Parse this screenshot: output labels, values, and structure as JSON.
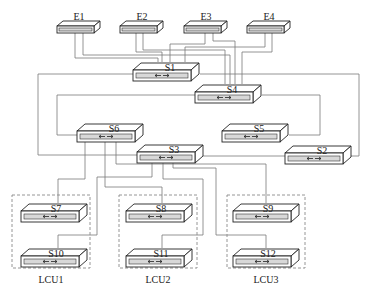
{
  "diagram": {
    "type": "network-topology",
    "nodes": {
      "E1": {
        "label": "E1",
        "kind": "endpoint-switch"
      },
      "E2": {
        "label": "E2",
        "kind": "endpoint-switch"
      },
      "E3": {
        "label": "E3",
        "kind": "endpoint-switch"
      },
      "E4": {
        "label": "E4",
        "kind": "endpoint-switch"
      },
      "S1": {
        "label": "S1",
        "kind": "switch"
      },
      "S2": {
        "label": "S2",
        "kind": "switch"
      },
      "S3": {
        "label": "S3",
        "kind": "switch"
      },
      "S4": {
        "label": "S4",
        "kind": "switch"
      },
      "S5": {
        "label": "S5",
        "kind": "switch"
      },
      "S6": {
        "label": "S6",
        "kind": "switch"
      },
      "S7": {
        "label": "S7",
        "kind": "switch"
      },
      "S8": {
        "label": "S8",
        "kind": "switch"
      },
      "S9": {
        "label": "S9",
        "kind": "switch"
      },
      "S10": {
        "label": "S10",
        "kind": "switch"
      },
      "S11": {
        "label": "S11",
        "kind": "switch"
      },
      "S12": {
        "label": "S12",
        "kind": "switch"
      }
    },
    "groups": [
      {
        "label": "LCU1",
        "members": [
          "S7",
          "S10"
        ]
      },
      {
        "label": "LCU2",
        "members": [
          "S8",
          "S11"
        ]
      },
      {
        "label": "LCU3",
        "members": [
          "S9",
          "S12"
        ]
      }
    ],
    "edges": [
      [
        "E1",
        "S1"
      ],
      [
        "E1",
        "S4"
      ],
      [
        "E2",
        "S1"
      ],
      [
        "E2",
        "S4"
      ],
      [
        "E3",
        "S1"
      ],
      [
        "E3",
        "S4"
      ],
      [
        "E4",
        "S1"
      ],
      [
        "E4",
        "S4"
      ],
      [
        "S1",
        "S2"
      ],
      [
        "S1",
        "S3"
      ],
      [
        "S4",
        "S5"
      ],
      [
        "S4",
        "S6"
      ],
      [
        "S6",
        "S7"
      ],
      [
        "S6",
        "S8"
      ],
      [
        "S6",
        "S9"
      ],
      [
        "S3",
        "S10"
      ],
      [
        "S3",
        "S11"
      ],
      [
        "S3",
        "S12"
      ]
    ],
    "colors": {
      "line": "#7a7a7a",
      "outline": "#222222",
      "panel": "#d8d8d8",
      "dashed_box": "#8a8a8a"
    }
  }
}
